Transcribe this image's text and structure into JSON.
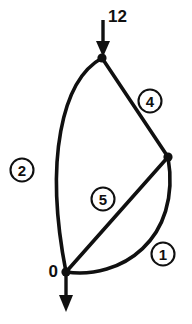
{
  "diagram": {
    "kind": "node-edge-graph",
    "background_color": "#ffffff",
    "stroke_color": "#101010",
    "canvas": {
      "width": 192,
      "height": 324
    },
    "nodes": [
      {
        "id": "top",
        "name": "node-top",
        "x": 102,
        "y": 58,
        "radius": 4.6
      },
      {
        "id": "right",
        "name": "node-right",
        "x": 168,
        "y": 157,
        "radius": 4.6
      },
      {
        "id": "bottom",
        "name": "node-bottom",
        "x": 66,
        "y": 272,
        "radius": 4.6
      }
    ],
    "edges": [
      {
        "id": "edge-1",
        "label": "1",
        "from": "bottom",
        "to": "right",
        "shape": "curve-right",
        "path": "M 66 272 C 120 280 182 240 168 157",
        "badge": {
          "x": 163,
          "y": 254,
          "r": 11.5
        }
      },
      {
        "id": "edge-2",
        "label": "2",
        "from": "top",
        "to": "bottom",
        "shape": "curve-left",
        "path": "M 102 58 C 62 80 44 160 66 272",
        "badge": {
          "x": 22,
          "y": 170,
          "r": 11.5
        }
      },
      {
        "id": "edge-4",
        "label": "4",
        "from": "top",
        "to": "right",
        "shape": "straight",
        "path": "M 102 58 L 168 157",
        "badge": {
          "x": 150,
          "y": 101,
          "r": 11.5
        }
      },
      {
        "id": "edge-5",
        "label": "5",
        "from": "bottom",
        "to": "right",
        "shape": "straight",
        "path": "M 66 272 L 168 157",
        "badge": {
          "x": 103,
          "y": 199,
          "r": 11.5
        }
      }
    ],
    "flow_arrows": [
      {
        "id": "inflow-top",
        "name": "inflow-arrow-top",
        "direction": "down",
        "label": "12",
        "shaft": {
          "x1": 103,
          "y1": 20,
          "x2": 103,
          "y2": 45
        },
        "head": "103,57 96,41 110,41",
        "label_pos": {
          "x": 108,
          "y": 16,
          "anchor": "start"
        }
      },
      {
        "id": "outflow-bottom",
        "name": "outflow-arrow-bottom",
        "direction": "down",
        "label": "0",
        "shaft": {
          "x1": 66,
          "y1": 272,
          "x2": 66,
          "y2": 297
        },
        "head": "66,312 59,295 73,295",
        "label_pos": {
          "x": 58,
          "y": 271,
          "anchor": "end"
        }
      }
    ]
  }
}
